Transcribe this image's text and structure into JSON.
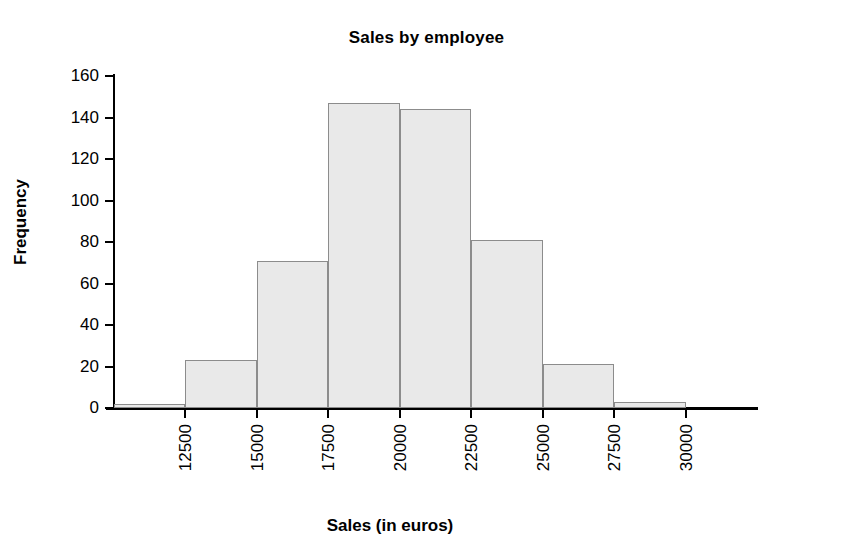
{
  "chart_data": {
    "type": "bar",
    "title": "Sales by employee",
    "xlabel": "Sales (in euros)",
    "ylabel": "Frequency",
    "subtitle": "",
    "grid": false,
    "legend": false,
    "legend_position": "none",
    "orientation": "vertical",
    "bin_width": 2500,
    "xlim": [
      10000,
      32500
    ],
    "ylim": [
      0,
      160
    ],
    "x_tick_labels": [
      "12500",
      "15000",
      "17500",
      "20000",
      "22500",
      "25000",
      "27500",
      "30000"
    ],
    "x_tick_values": [
      12500,
      15000,
      17500,
      20000,
      22500,
      25000,
      27500,
      30000
    ],
    "y_tick_labels": [
      "0",
      "20",
      "40",
      "60",
      "80",
      "100",
      "120",
      "140",
      "160"
    ],
    "y_tick_values": [
      0,
      20,
      40,
      60,
      80,
      100,
      120,
      140,
      160
    ],
    "categories": [
      "10000-12500",
      "12500-15000",
      "15000-17500",
      "17500-20000",
      "20000-22500",
      "22500-25000",
      "25000-27500",
      "27500-30000",
      "30000-32500"
    ],
    "bin_edges": [
      10000,
      12500,
      15000,
      17500,
      20000,
      22500,
      25000,
      27500,
      30000,
      32500
    ],
    "values": [
      2,
      23,
      71,
      147,
      144,
      81,
      21,
      3,
      0
    ],
    "colors": {
      "bar_fill": "#e9e9e9",
      "bar_edge": "#8c8c8c",
      "axis": "#000000",
      "text": "#000000",
      "background": "#ffffff"
    }
  }
}
